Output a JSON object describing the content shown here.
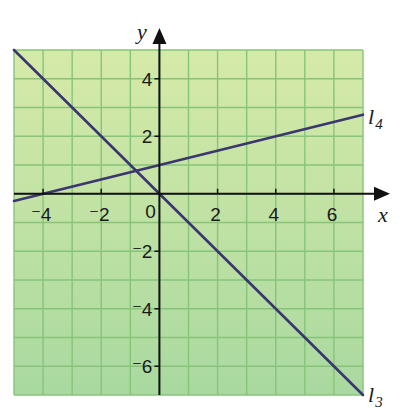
{
  "chart_data": {
    "type": "line",
    "title": "",
    "xlabel": "x",
    "ylabel": "y",
    "xlim": [
      -5,
      7
    ],
    "ylim": [
      -7,
      5
    ],
    "grid": true,
    "x_ticks": [
      {
        "value": -4,
        "label": "⁻4"
      },
      {
        "value": -2,
        "label": "⁻2"
      },
      {
        "value": 2,
        "label": "2"
      },
      {
        "value": 4,
        "label": "4"
      },
      {
        "value": 6,
        "label": "6"
      }
    ],
    "y_ticks": [
      {
        "value": 4,
        "label": "4"
      },
      {
        "value": 2,
        "label": "2"
      },
      {
        "value": -2,
        "label": "⁻2"
      },
      {
        "value": -4,
        "label": "⁻4"
      },
      {
        "value": -6,
        "label": "⁻6"
      }
    ],
    "origin_label": "0",
    "series": [
      {
        "name": "l3",
        "label_main": "l",
        "label_sub": "3",
        "equation": "y = -x",
        "points": [
          [
            -5,
            5
          ],
          [
            7,
            -7
          ]
        ]
      },
      {
        "name": "l4",
        "label_main": "l",
        "label_sub": "4",
        "equation": "y = 0.25x + 1",
        "points": [
          [
            -5,
            -0.25
          ],
          [
            7,
            2.75
          ]
        ]
      }
    ],
    "intersection": [
      -0.8,
      0.8
    ]
  },
  "style": {
    "background_top": "#d6eaa8",
    "background_bottom": "#a9d9a0",
    "grid_color": "#86c47a",
    "line_color": "#3b3670",
    "axis_color": "#111111"
  }
}
